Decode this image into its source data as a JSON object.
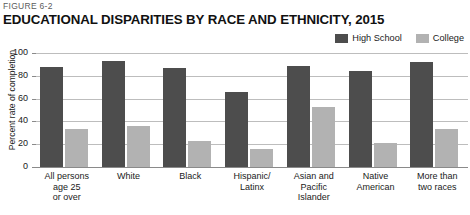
{
  "figure_label": "FIGURE 6-2",
  "title": "EDUCATIONAL DISPARITIES BY RACE AND ETHNICITY, 2015",
  "colors": {
    "high_school": "#4d4d4d",
    "college": "#b2b2b2",
    "gridline": "#bdbdbd",
    "text": "#1a1a1a"
  },
  "legend": {
    "position": "top-right",
    "entries": [
      {
        "label": "High School",
        "color": "#4d4d4d"
      },
      {
        "label": "College",
        "color": "#b2b2b2"
      }
    ]
  },
  "axes": {
    "y_title": "Percent rate of completion",
    "y_ticks": [
      "100",
      "80",
      "60",
      "40",
      "20",
      "0"
    ]
  },
  "chart_data": {
    "type": "bar",
    "title": "EDUCATIONAL DISPARITIES BY RACE AND ETHNICITY, 2015",
    "xlabel": "",
    "ylabel": "Percent rate of completion",
    "ylim": [
      0,
      100
    ],
    "yticks": [
      0,
      20,
      40,
      60,
      80,
      100
    ],
    "grid": true,
    "legend_position": "top-right",
    "categories": [
      "All persons age 25 or over",
      "White",
      "Black",
      "Hispanic/Latinx",
      "Asian and Pacific Islander",
      "Native American",
      "More than two races"
    ],
    "category_lines": [
      [
        "All persons",
        "age 25",
        "or over"
      ],
      [
        "White"
      ],
      [
        "Black"
      ],
      [
        "Hispanic/",
        "Latinx"
      ],
      [
        "Asian and",
        "Pacific",
        "Islander"
      ],
      [
        "Native",
        "American"
      ],
      [
        "More than",
        "two races"
      ]
    ],
    "series": [
      {
        "name": "High School",
        "color": "#4d4d4d",
        "values": [
          88,
          93,
          87,
          66,
          89,
          84,
          92
        ]
      },
      {
        "name": "College",
        "color": "#b2b2b2",
        "values": [
          33,
          36,
          23,
          16,
          53,
          21,
          33
        ]
      }
    ]
  }
}
